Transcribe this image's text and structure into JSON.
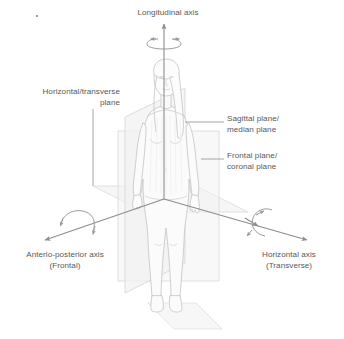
{
  "figure": {
    "background_color": "#ffffff",
    "label_color": "#58585a",
    "line_color": "#8a8a8c",
    "plane_fill": "#f2f2f2",
    "plane_stroke": "#d8d8d8",
    "body_stroke": "#c9c9c9",
    "body_fill": "#fafafa"
  },
  "labels": {
    "longitudinal_axis": "Longitudinal axis",
    "transverse_plane": "Horizontal/transverse\nplane",
    "sagittal_plane": "Sagittal plane/\nmedian plane",
    "frontal_plane": "Frontal plane/\ncoronal plane",
    "anterio_posterior_axis": "Anterio-posterior axis\n(Frontal)",
    "horizontal_axis": "Horizontal axis\n(Transverse)"
  },
  "diagram_parts": {
    "axes": [
      {
        "name": "longitudinal-axis",
        "label": "Longitudinal axis",
        "direction": "vertical",
        "arrowhead": "up",
        "rotation_indicator": "ellipse-with-two-arrows"
      },
      {
        "name": "anterio-posterior-axis",
        "label": "Anterio-posterior axis (Frontal)",
        "direction": "down-left",
        "arrowhead": "down-left",
        "rotation_indicator": "arc-with-two-arrows"
      },
      {
        "name": "horizontal-axis",
        "label": "Horizontal axis (Transverse)",
        "direction": "down-right",
        "arrowhead": "down-right",
        "rotation_indicator": "arc-with-two-arrows"
      }
    ],
    "planes": [
      {
        "name": "transverse-plane",
        "label": "Horizontal/transverse plane",
        "orientation": "horizontal"
      },
      {
        "name": "sagittal-plane",
        "label": "Sagittal plane/median plane",
        "orientation": "vertical-antero-posterior"
      },
      {
        "name": "frontal-plane",
        "label": "Frontal plane/coronal plane",
        "orientation": "vertical-lateral"
      }
    ],
    "body_figure": {
      "name": "human-body-figure",
      "description": "standing female figure, anatomical position, facing viewer"
    },
    "base_platform": {
      "name": "base-platform",
      "description": "small parallelogram platform beneath the feet"
    }
  }
}
